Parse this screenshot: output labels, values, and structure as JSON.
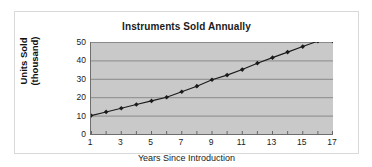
{
  "chart_data": {
    "type": "line",
    "title": "Instruments Sold Annually",
    "xlabel": "Years Since Introduction",
    "ylabel_line1": "Units Sold",
    "ylabel_line2": "(thousand)",
    "x": [
      1,
      2,
      3,
      4,
      5,
      6,
      7,
      8,
      9,
      10,
      11,
      12,
      13,
      14,
      15,
      16,
      17
    ],
    "values": [
      10,
      12,
      14,
      16,
      18,
      20,
      23,
      26,
      29.5,
      32,
      35,
      38.5,
      41.5,
      44.5,
      47.5,
      50.5,
      50.5
    ],
    "xlim": [
      1,
      17
    ],
    "ylim": [
      0,
      50
    ],
    "y_ticks": [
      50,
      40,
      30,
      20,
      10,
      0
    ],
    "x_ticks": [
      1,
      3,
      5,
      7,
      9,
      11,
      13,
      15,
      17
    ],
    "x_minor_ticks": [
      1,
      2,
      3,
      4,
      5,
      6,
      7,
      8,
      9,
      10,
      11,
      12,
      13,
      14,
      15,
      16,
      17
    ],
    "grid": "horizontal",
    "legend": null,
    "marker": "diamond",
    "series_color": "#1a1a1a",
    "plot_background": "#c9c9c9",
    "gridline_color": "#7a7a7a",
    "axis_color": "#4d4d4d"
  }
}
